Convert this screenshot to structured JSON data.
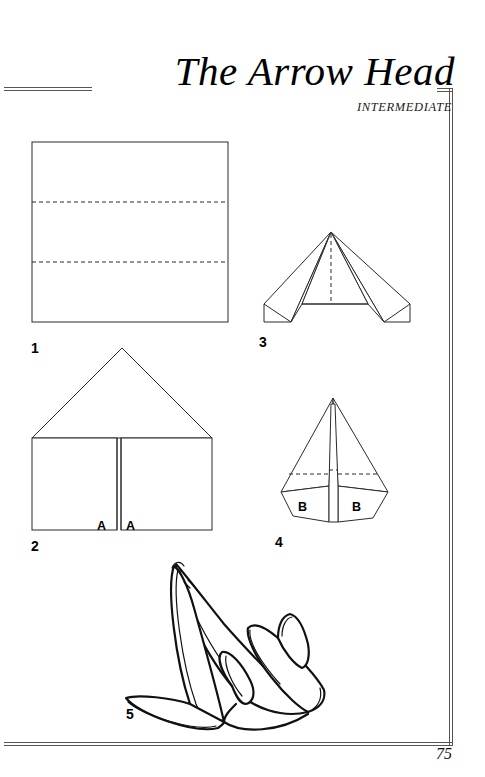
{
  "header": {
    "title": "The Arrow Head",
    "difficulty": "INTERMEDIATE"
  },
  "page_number": "75",
  "steps": [
    {
      "number": "1",
      "label_x": 31,
      "label_y": 340
    },
    {
      "number": "2",
      "label_x": 31,
      "label_y": 538
    },
    {
      "number": "3",
      "label_x": 259,
      "label_y": 334
    },
    {
      "number": "4",
      "label_x": 275,
      "label_y": 534
    },
    {
      "number": "5",
      "label_x": 126,
      "label_y": 706
    }
  ],
  "fold_labels": [
    {
      "text": "A",
      "x": 97,
      "y": 519
    },
    {
      "text": "A",
      "x": 126,
      "y": 519
    },
    {
      "text": "B",
      "x": 298,
      "y": 500
    },
    {
      "text": "B",
      "x": 352,
      "y": 500
    }
  ],
  "colors": {
    "ink": "#2b2b2b",
    "bold_ink": "#111111",
    "rule": "#555555",
    "paper": "#ffffff"
  }
}
